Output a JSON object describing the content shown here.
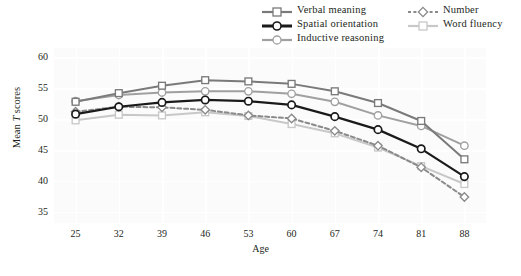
{
  "chart_data": {
    "type": "line",
    "title": "",
    "xlabel": "Age",
    "ylabel": "Mean T scores",
    "x": [
      25,
      32,
      39,
      46,
      53,
      60,
      67,
      74,
      81,
      88
    ],
    "categories": [
      "25",
      "32",
      "39",
      "46",
      "53",
      "60",
      "67",
      "74",
      "81",
      "88"
    ],
    "xticks": [
      "25",
      "32",
      "39",
      "46",
      "53",
      "60",
      "67",
      "74",
      "81",
      "88"
    ],
    "yticks": [
      "35",
      "40",
      "45",
      "50",
      "55",
      "60"
    ],
    "ylim": [
      33.2,
      61.5
    ],
    "xlim": [
      21.5,
      91.5
    ],
    "grid": true,
    "legend_position": "top-right",
    "series": [
      {
        "name": "Verbal meaning",
        "color": "#7a7a7a",
        "marker": "square",
        "dash": "solid",
        "width": 2.0,
        "values": [
          52.8,
          54.2,
          55.4,
          56.3,
          56.1,
          55.7,
          54.5,
          52.6,
          49.7,
          43.5
        ]
      },
      {
        "name": "Spatial orientation",
        "color": "#1a1a1a",
        "marker": "circle",
        "dash": "solid",
        "width": 2.2,
        "values": [
          50.8,
          52.0,
          52.7,
          53.1,
          52.9,
          52.3,
          50.4,
          48.3,
          45.2,
          40.7
        ]
      },
      {
        "name": "Inductive reasoning",
        "color": "#a0a0a0",
        "marker": "circle",
        "dash": "solid",
        "width": 2.0,
        "values": [
          52.9,
          53.9,
          54.3,
          54.5,
          54.5,
          54.1,
          52.8,
          50.6,
          48.9,
          45.7
        ]
      },
      {
        "name": "Number",
        "color": "#8a8a8a",
        "marker": "diamond",
        "dash": "dashed",
        "width": 2.0,
        "values": [
          51.2,
          52.0,
          51.9,
          51.5,
          50.6,
          50.1,
          48.1,
          45.7,
          42.2,
          37.4
        ]
      },
      {
        "name": "Word fluency",
        "color": "#c8c8c8",
        "marker": "square",
        "dash": "solid",
        "width": 2.0,
        "values": [
          49.8,
          50.7,
          50.6,
          51.1,
          50.5,
          49.2,
          47.7,
          45.4,
          42.4,
          39.5
        ]
      }
    ]
  },
  "legend": {
    "column_a": [
      {
        "label": "Verbal meaning"
      },
      {
        "label": "Spatial orientation"
      },
      {
        "label": "Inductive reasoning"
      }
    ],
    "column_b": [
      {
        "label": "Number"
      },
      {
        "label": "Word fluency"
      }
    ]
  },
  "axes": {
    "y_title_prefix": "Mean ",
    "y_title_italic": "T",
    "y_title_suffix": " scores",
    "x_title": "Age"
  }
}
